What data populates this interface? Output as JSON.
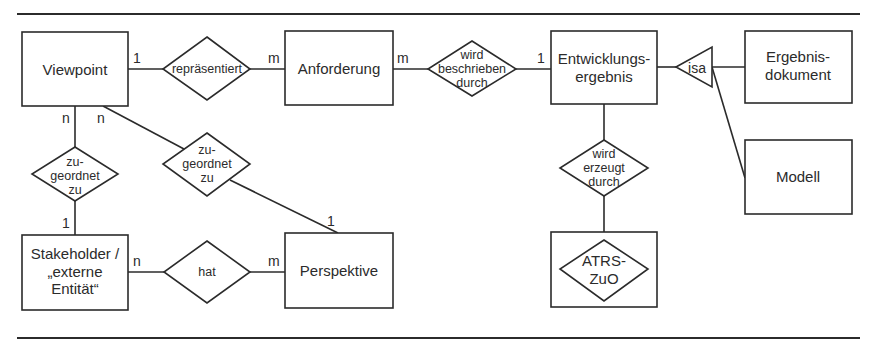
{
  "diagram": {
    "type": "entity-relationship",
    "entities": [
      {
        "id": "viewpoint",
        "label": "Viewpoint"
      },
      {
        "id": "anforderung",
        "label": "Anforderung"
      },
      {
        "id": "entwicklungsergebnis",
        "label": "Entwicklungs-\nergebnis",
        "lines": [
          "Entwicklungs-",
          "ergebnis"
        ]
      },
      {
        "id": "ergebnisdokument",
        "label": "Ergebnis-\ndokument",
        "lines": [
          "Ergebnis-",
          "dokument"
        ]
      },
      {
        "id": "modell",
        "label": "Modell"
      },
      {
        "id": "stakeholder",
        "label": "Stakeholder / „externe Entität“",
        "lines": [
          "Stakeholder /",
          "„externe",
          "Entität“"
        ]
      },
      {
        "id": "perspektive",
        "label": "Perspektive"
      },
      {
        "id": "atrs_zuo",
        "label": "ATRS-ZuO",
        "lines": [
          "ATRS-",
          "ZuO"
        ],
        "note": "entity box containing a diamond"
      }
    ],
    "relationships": [
      {
        "id": "repraesentiert",
        "lines": [
          "repräsentiert"
        ],
        "from": "viewpoint",
        "to": "anforderung",
        "from_card": "1",
        "to_card": "m"
      },
      {
        "id": "wird_beschrieben_durch",
        "lines": [
          "wird",
          "beschrieben",
          "durch"
        ],
        "from": "anforderung",
        "to": "entwicklungsergebnis",
        "from_card": "m",
        "to_card": "1"
      },
      {
        "id": "zugeordnet_zu_left",
        "lines": [
          "zu-",
          "geordnet",
          "zu"
        ],
        "from": "viewpoint",
        "to": "stakeholder",
        "from_card": "n",
        "to_card": "1"
      },
      {
        "id": "zugeordnet_zu_mid",
        "lines": [
          "zu-",
          "geordnet",
          "zu"
        ],
        "from": "viewpoint",
        "to": "perspektive",
        "from_card": "n",
        "to_card": "1"
      },
      {
        "id": "hat",
        "lines": [
          "hat"
        ],
        "from": "stakeholder",
        "to": "perspektive",
        "from_card": "n",
        "to_card": "m"
      },
      {
        "id": "wird_erzeugt_durch",
        "lines": [
          "wird",
          "erzeugt",
          "durch"
        ],
        "from": "entwicklungsergebnis",
        "to": "atrs_zuo"
      }
    ],
    "isa": {
      "label": "isa",
      "parent": "entwicklungsergebnis",
      "children": [
        "ergebnisdokument",
        "modell"
      ]
    },
    "cardinalities": {
      "vp_rep": "1",
      "rep_anf": "m",
      "anf_wbd": "m",
      "wbd_ent": "1",
      "vp_zu_left": "n",
      "vp_zu_mid": "n",
      "zu_left_stk": "1",
      "zu_mid_persp": "1",
      "stk_hat": "n",
      "hat_persp": "m"
    },
    "colors": {
      "stroke": "#2b2b2b",
      "text": "#2b2b2b",
      "background": "#ffffff"
    }
  }
}
